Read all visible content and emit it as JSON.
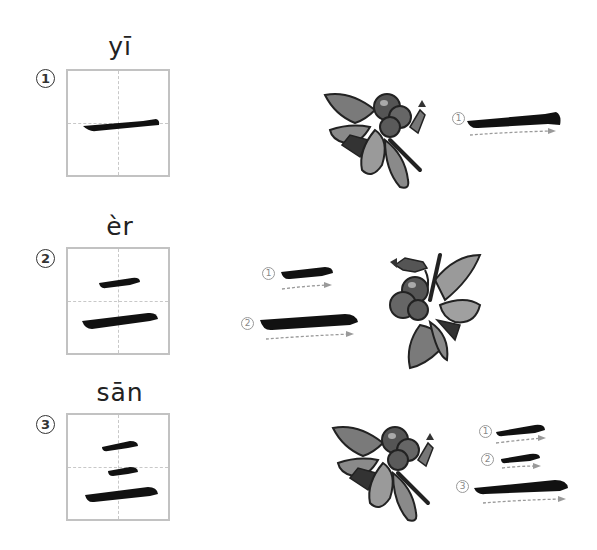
{
  "rows": [
    {
      "index": "1",
      "pinyin": "yī",
      "character": "一",
      "stroke_count": 1,
      "stroke_labels": [
        "1"
      ]
    },
    {
      "index": "2",
      "pinyin": "èr",
      "character": "二",
      "stroke_count": 2,
      "stroke_labels": [
        "1",
        "2"
      ]
    },
    {
      "index": "3",
      "pinyin": "sān",
      "character": "三",
      "stroke_count": 3,
      "stroke_labels": [
        "1",
        "2",
        "3"
      ]
    }
  ],
  "colors": {
    "ink": "#111111",
    "grid_border": "#c2c2c2",
    "grid_guide": "#c8c8c8",
    "arrow": "#9a9a9a",
    "bee_dark": "#2a2a2a",
    "bee_mid": "#6a6a6a",
    "bee_light": "#a8a8a8"
  },
  "icons": {
    "bee": "bee-illustration-icon",
    "direction": "dashed-arrow-icon"
  }
}
